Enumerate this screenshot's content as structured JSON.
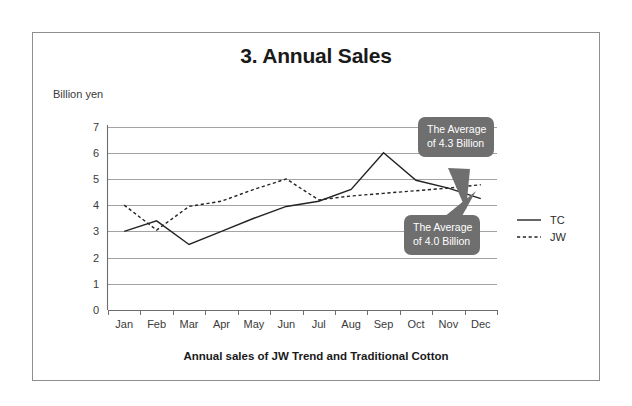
{
  "document": {
    "title": "3. Annual Sales",
    "caption": "Annual sales of JW Trend and Traditional Cotton"
  },
  "axes": {
    "y_axis_title": "Billion yen",
    "y_ticks": [
      "0",
      "1",
      "2",
      "3",
      "4",
      "5",
      "6",
      "7"
    ],
    "x_ticks": [
      "Jan",
      "Feb",
      "Mar",
      "Apr",
      "May",
      "Jun",
      "Jul",
      "Aug",
      "Sep",
      "Oct",
      "Nov",
      "Dec"
    ]
  },
  "legend": {
    "items": [
      {
        "label": "TC",
        "style": "solid"
      },
      {
        "label": "JW",
        "style": "dashed"
      }
    ]
  },
  "callouts": [
    {
      "id": "average-jw",
      "line1": "The Average",
      "line2": "of 4.3 Billion",
      "value": 4.3,
      "target_series": "JW"
    },
    {
      "id": "average-tc",
      "line1": "The Average",
      "line2": "of 4.0 Billion",
      "value": 4.0,
      "target_series": "TC"
    }
  ],
  "colors": {
    "frame": "#8e8e8e",
    "grid": "#8a8a8a",
    "axis": "#6d6d6d",
    "series": "#242424",
    "callout_bg": "#6f6f6f",
    "callout_text": "#ffffff",
    "title_text": "#1a1a1a"
  },
  "chart_data": {
    "type": "line",
    "title": "3. Annual Sales",
    "subtitle": "Annual sales of JW Trend and Traditional Cotton",
    "xlabel": "",
    "ylabel": "Billion yen",
    "ylim": [
      0,
      7
    ],
    "yticks": [
      0,
      1,
      2,
      3,
      4,
      5,
      6,
      7
    ],
    "grid": true,
    "legend_position": "right",
    "categories": [
      "Jan",
      "Feb",
      "Mar",
      "Apr",
      "May",
      "Jun",
      "Jul",
      "Aug",
      "Sep",
      "Oct",
      "Nov",
      "Dec"
    ],
    "series": [
      {
        "name": "TC",
        "style": "solid",
        "values": [
          3.0,
          3.4,
          2.5,
          3.0,
          3.5,
          3.95,
          4.15,
          4.6,
          6.0,
          4.95,
          4.65,
          4.25
        ],
        "average": 4.0
      },
      {
        "name": "JW",
        "style": "dashed",
        "values": [
          4.0,
          3.05,
          3.95,
          4.15,
          4.6,
          5.0,
          4.2,
          4.35,
          4.45,
          4.55,
          4.65,
          4.78
        ],
        "average": 4.3
      }
    ],
    "annotations": [
      {
        "text": "The Average of 4.3 Billion",
        "points_to": "JW Dec endpoint"
      },
      {
        "text": "The Average of 4.0 Billion",
        "points_to": "TC Dec endpoint"
      }
    ]
  }
}
